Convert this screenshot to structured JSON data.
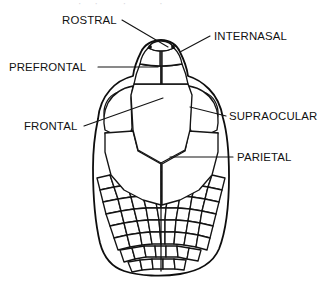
{
  "figure": {
    "view": "dorsal",
    "style": "line-art-diagram",
    "background_color": "#ffffff",
    "line_color": "#141414",
    "text_color": "#111111",
    "clipped_top_caption": "·   ·      ·        ·"
  },
  "labels": [
    {
      "id": "rostral",
      "text": "ROSTRAL",
      "text_x": 62,
      "text_y": 24,
      "anchor": "start",
      "leader": "M 122 20 L 168 47",
      "side": "top-left"
    },
    {
      "id": "internasal",
      "text": "INTERNASAL",
      "text_x": 214,
      "text_y": 40,
      "anchor": "start",
      "leader": "M 210 36 L 180 52",
      "side": "top-right"
    },
    {
      "id": "prefrontal",
      "text": "PREFRONTAL",
      "text_x": 9,
      "text_y": 71,
      "anchor": "start",
      "leader": "M 98 67 L 158 67",
      "side": "left"
    },
    {
      "id": "frontal",
      "text": "FRONTAL",
      "text_x": 24,
      "text_y": 130,
      "anchor": "start",
      "leader": "M 84 126 L 163 98",
      "side": "left"
    },
    {
      "id": "supraocular",
      "text": "SUPRAOCULAR",
      "text_x": 229,
      "text_y": 120,
      "anchor": "start",
      "leader": "M 226 116 L 190 107",
      "side": "right"
    },
    {
      "id": "parietal",
      "text": "PARIETAL",
      "text_x": 237,
      "text_y": 161,
      "anchor": "start",
      "leader": "M 233 157 L 170 157",
      "side": "right"
    }
  ],
  "anatomy": {
    "head_outline": "M 161 40 C 152 40 144 45 141 52 C 137 60 134 68 133 76 C 125 78 116 83 110 90 C 103 98 99 108 98 119 C 95 133 93 150 93 168 C 93 196 95 222 100 243 C 104 258 112 267 124 271 C 140 276 162 277 180 274 C 199 271 213 263 219 249 C 226 231 229 205 229 176 C 229 152 227 132 223 118 C 221 106 216 96 209 89 C 203 83 195 78 188 76 C 187 68 184 60 180 52 C 177 45 170 40 161 40 Z",
    "rostral": "M 161 41 C 155 41 150 44 148 48 C 152 50 157 51 161 51 C 165 51 170 50 174 48 C 172 44 167 41 161 41 Z",
    "internasal_left": "M 148 48 C 144 52 141 58 140 64 C 146 65 152 66 160 66 L 160 51 C 156 51 152 50 148 48 Z",
    "internasal_right": "M 174 48 C 178 52 181 58 182 64 C 176 65 170 66 162 66 L 162 51 C 166 51 170 50 174 48 Z",
    "prefrontal_left": "M 140 64 C 137 71 135 78 134 84 L 161 84 L 161 66 C 153 66 146 65 140 64 Z",
    "prefrontal_right": "M 182 64 C 185 71 187 78 188 84 L 162 84 L 162 66 C 170 66 177 65 182 64 Z",
    "frontal": "M 134 84 L 188 84 L 192 95 L 190 130 L 185 150 L 161 163 L 138 150 L 133 130 L 131 95 Z",
    "supraocular_left": "M 133 86 C 122 88 113 94 108 103 C 104 111 103 121 105 130 C 112 134 121 136 130 135 L 132 128 L 131 98 Z",
    "supraocular_right": "M 189 86 C 200 88 209 94 214 103 C 218 111 219 121 217 130 C 210 134 201 136 192 135 L 190 128 L 191 98 Z",
    "eye_left": "M 116 93 C 109 96 104 104 104 113 C 104 122 110 129 118 130 C 126 131 133 125 134 116 C 135 105 127 94 116 93 Z",
    "eye_right": "M 206 93 C 213 96 218 104 218 113 C 218 122 212 129 204 130 C 196 131 189 125 188 116 C 187 105 195 94 206 93 Z",
    "parietal_left": "M 133 131 L 138 151 L 161 164 L 161 205 L 143 200 L 124 190 L 111 175 L 105 152 L 105 133 Z",
    "parietal_right": "M 189 131 L 185 151 L 162 164 L 162 205 L 180 200 L 199 190 L 212 175 L 218 152 L 218 133 Z",
    "midline": "M 161 51 L 161 66 M 161 66 L 161 84 M 161 163 L 161 271",
    "nostrils": [
      {
        "cx": 150,
        "cy": 47,
        "r": 1.9
      },
      {
        "cx": 173,
        "cy": 47,
        "r": 1.9
      }
    ],
    "temporal_scales": [
      "M 105 133 L 119 131 L 124 142 L 110 146 Z",
      "M 119 131 L 132 130 L 136 141 L 124 142 Z",
      "M 110 146 L 124 142 L 129 154 L 114 158 Z",
      "M 124 142 L 136 141 L 140 153 L 129 154 Z",
      "M 114 158 L 129 154 L 133 166 L 118 170 Z",
      "M 129 154 L 140 153 L 145 165 L 133 166 Z",
      "M 118 170 L 133 166 L 138 178 L 122 182 Z",
      "M 133 166 L 145 165 L 150 177 L 138 178 Z",
      "M 218 133 L 204 131 L 199 142 L 213 146 Z",
      "M 204 131 L 191 130 L 187 141 L 199 142 Z",
      "M 213 146 L 199 142 L 194 154 L 209 158 Z",
      "M 199 142 L 187 141 L 183 153 L 194 154 Z",
      "M 209 158 L 194 154 L 190 166 L 205 170 Z",
      "M 194 154 L 183 153 L 178 165 L 190 166 Z",
      "M 205 170 L 190 166 L 185 178 L 201 182 Z",
      "M 190 166 L 178 165 L 173 177 L 185 178 Z"
    ],
    "dorsal_scale_rows": [
      [
        "M 97 178 L 110 175 L 114 187 L 100 190 Z",
        "M 110 175 L 123 173 L 127 185 L 114 187 Z",
        "M 123 173 L 136 172 L 140 184 L 127 185 Z",
        "M 136 172 L 149 172 L 152 184 L 140 184 Z",
        "M 149 172 L 161 172 L 161 184 L 152 184 Z",
        "M 161 172 L 173 172 L 170 184 L 161 184 Z",
        "M 173 172 L 186 172 L 182 184 L 170 184 Z",
        "M 186 172 L 199 173 L 195 185 L 182 184 Z",
        "M 199 173 L 212 175 L 208 187 L 195 185 Z",
        "M 212 175 L 225 178 L 222 190 L 208 187 Z"
      ],
      [
        "M 100 190 L 114 187 L 118 199 L 103 202 Z",
        "M 114 187 L 127 185 L 131 197 L 118 199 Z",
        "M 127 185 L 140 184 L 143 196 L 131 197 Z",
        "M 140 184 L 152 184 L 155 196 L 143 196 Z",
        "M 152 184 L 161 184 L 161 196 L 155 196 Z",
        "M 161 184 L 170 184 L 168 196 L 161 196 Z",
        "M 170 184 L 182 184 L 180 196 L 168 196 Z",
        "M 182 184 L 195 185 L 192 197 L 180 196 Z",
        "M 195 185 L 208 187 L 205 199 L 192 197 Z",
        "M 208 187 L 222 190 L 219 202 L 205 199 Z"
      ],
      [
        "M 103 202 L 118 199 L 121 211 L 106 214 Z",
        "M 118 199 L 131 197 L 134 209 L 121 211 Z",
        "M 131 197 L 143 196 L 146 208 L 134 209 Z",
        "M 143 196 L 155 196 L 157 208 L 146 208 Z",
        "M 155 196 L 161 196 L 161 208 L 157 208 Z",
        "M 161 196 L 168 196 L 166 208 L 161 208 Z",
        "M 168 196 L 180 196 L 178 208 L 166 208 Z",
        "M 180 196 L 192 197 L 190 209 L 178 208 Z",
        "M 192 197 L 205 199 L 202 211 L 190 209 Z",
        "M 205 199 L 219 202 L 216 214 L 202 211 Z"
      ],
      [
        "M 106 214 L 121 211 L 124 223 L 110 226 Z",
        "M 121 211 L 134 209 L 137 221 L 124 223 Z",
        "M 134 209 L 146 208 L 148 220 L 137 221 Z",
        "M 146 208 L 157 208 L 159 220 L 148 220 Z",
        "M 157 208 L 166 208 L 165 220 L 159 220 Z",
        "M 166 208 L 178 208 L 176 220 L 165 220 Z",
        "M 178 208 L 190 209 L 188 221 L 176 220 Z",
        "M 190 209 L 202 211 L 200 223 L 188 221 Z",
        "M 202 211 L 216 214 L 213 226 L 200 223 Z"
      ],
      [
        "M 110 226 L 124 223 L 127 235 L 114 238 Z",
        "M 124 223 L 137 221 L 140 233 L 127 235 Z",
        "M 137 221 L 148 220 L 150 232 L 140 233 Z",
        "M 148 220 L 159 220 L 160 232 L 150 232 Z",
        "M 159 220 L 165 220 L 165 232 L 160 232 Z",
        "M 165 220 L 176 220 L 175 232 L 165 232 Z",
        "M 176 220 L 188 221 L 186 233 L 175 232 Z",
        "M 188 221 L 200 223 L 198 235 L 186 233 Z",
        "M 200 223 L 213 226 L 210 238 L 198 235 Z"
      ],
      [
        "M 114 238 L 127 235 L 130 247 L 118 250 Z",
        "M 127 235 L 140 233 L 142 245 L 130 247 Z",
        "M 140 233 L 150 232 L 152 244 L 142 245 Z",
        "M 150 232 L 160 232 L 161 244 L 152 244 Z",
        "M 160 232 L 165 232 L 165 244 L 161 244 Z",
        "M 165 232 L 175 232 L 174 244 L 165 244 Z",
        "M 175 232 L 186 233 L 184 245 L 174 244 Z",
        "M 186 233 L 198 235 L 196 247 L 184 245 Z",
        "M 198 235 L 210 238 L 207 250 L 196 247 Z"
      ],
      [
        "M 120 250 L 132 248 L 135 259 L 124 262 Z",
        "M 132 248 L 144 246 L 146 257 L 135 259 Z",
        "M 144 246 L 155 246 L 156 257 L 146 257 Z",
        "M 155 246 L 166 246 L 166 257 L 156 257 Z",
        "M 166 246 L 177 246 L 178 257 L 166 257 Z",
        "M 177 246 L 189 248 L 187 259 L 178 257 Z",
        "M 189 248 L 201 250 L 198 261 L 187 259 Z"
      ],
      [
        "M 128 262 L 140 260 L 142 270 L 132 272 Z",
        "M 140 260 L 152 259 L 153 269 L 142 270 Z",
        "M 152 259 L 163 259 L 163 269 L 153 269 Z",
        "M 163 259 L 174 259 L 175 269 L 163 269 Z",
        "M 174 259 L 186 260 L 184 270 L 175 269 Z"
      ]
    ]
  }
}
